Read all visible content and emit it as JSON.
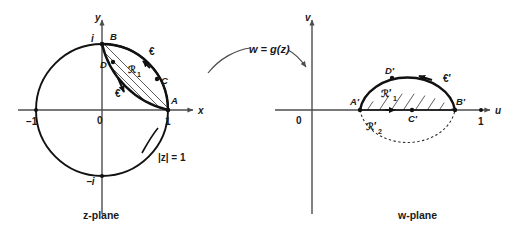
{
  "figure": {
    "mapping_label": "w = g(z)"
  },
  "z_plane": {
    "caption": "z-plane",
    "axis_x_label": "x",
    "axis_y_label": "y",
    "origin_label": "0",
    "circle_label": "|z| = 1",
    "ticks": [
      {
        "name": "minus-one",
        "label": "−1"
      },
      {
        "name": "one",
        "label": "1"
      },
      {
        "name": "i",
        "label": "i"
      },
      {
        "name": "minus-i",
        "label": "−i"
      }
    ],
    "points": [
      {
        "name": "A",
        "label": "A"
      },
      {
        "name": "B",
        "label": "B"
      },
      {
        "name": "C",
        "label": "C"
      },
      {
        "name": "D",
        "label": "D"
      }
    ],
    "region_label": "ℛ",
    "region_sub": "1",
    "curve_labels": [
      {
        "name": "curve-upper",
        "label": "€"
      },
      {
        "name": "curve-lower",
        "label": "€"
      }
    ]
  },
  "w_plane": {
    "caption": "w-plane",
    "axis_u_label": "u",
    "axis_v_label": "v",
    "origin_label": "0",
    "ticks": [
      {
        "name": "one",
        "label": "1"
      }
    ],
    "points": [
      {
        "name": "A-prime",
        "label": "A′"
      },
      {
        "name": "B-prime",
        "label": "B′"
      },
      {
        "name": "C-prime",
        "label": "C′"
      },
      {
        "name": "D-prime",
        "label": "D′"
      }
    ],
    "region1_label": "ℛ′",
    "region1_sub": "1",
    "region2_label": "ℛ′",
    "region2_sub": "2",
    "curve_label": "€′"
  },
  "colors": {
    "ink": "#111111",
    "axis": "#4d4d4d",
    "hatch": "#333333",
    "background": "#ffffff"
  }
}
